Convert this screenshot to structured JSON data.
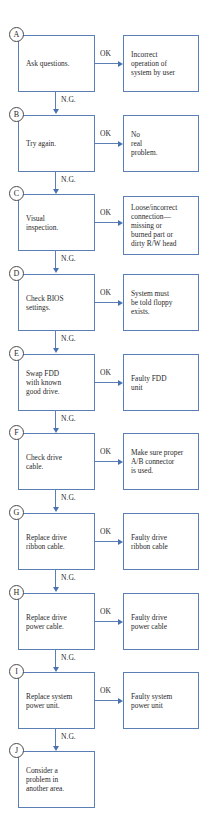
{
  "diagram": {
    "type": "flowchart",
    "colors": {
      "line": "#5a7fb5",
      "arrow": "#4a72b0",
      "text": "#2a2a2a",
      "circle": "#4a4a4a"
    },
    "branch_labels": {
      "ok": "OK",
      "ng": "N.G."
    },
    "steps": [
      {
        "id": "A",
        "action": "Ask questions.",
        "ok_result": "Incorrect\noperation of\nsystem by user"
      },
      {
        "id": "B",
        "action": "Try again.",
        "ok_result": "No\nreal\nproblem."
      },
      {
        "id": "C",
        "action": "Visual\ninspection.",
        "ok_result": "Loose/incorrect\nconnection—\nmissing or\nburned part or\ndirty R/W head"
      },
      {
        "id": "D",
        "action": "Check BIOS\nsettings.",
        "ok_result": "System must\nbe told floppy\nexists."
      },
      {
        "id": "E",
        "action": "Swap FDD\nwith known\ngood drive.",
        "ok_result": "Faulty FDD\nunit"
      },
      {
        "id": "F",
        "action": "Check drive\ncable.",
        "ok_result": "Make sure proper\nA/B connector\nis used."
      },
      {
        "id": "G",
        "action": "Replace drive\nribbon cable.",
        "ok_result": "Faulty drive\nribbon cable"
      },
      {
        "id": "H",
        "action": "Replace drive\npower cable.",
        "ok_result": "Faulty drive\npower cable"
      },
      {
        "id": "I",
        "action": "Replace system\npower unit.",
        "ok_result": "Faulty system\npower unit"
      },
      {
        "id": "J",
        "action": "Consider a\nproblem in\nanother area."
      }
    ]
  }
}
